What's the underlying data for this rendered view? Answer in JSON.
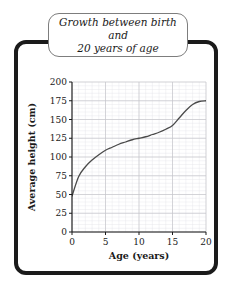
{
  "figure": {
    "title": "Growth between birth and 20 years of age",
    "title_line1": "Growth between birth and",
    "title_line2": "20 years of age",
    "frame_color": "#1b1b1b",
    "background_color": "#ffffff"
  },
  "chart_data": {
    "type": "line",
    "title": "Growth between birth and 20 years of age",
    "xlabel": "Age (years)",
    "ylabel": "Average height (cm)",
    "xlim": [
      0,
      20
    ],
    "ylim": [
      0,
      200
    ],
    "xticks": [
      0,
      5,
      10,
      15,
      20
    ],
    "yticks": [
      0,
      25,
      50,
      75,
      100,
      125,
      150,
      175,
      200
    ],
    "xtick_labels": [
      "0",
      "5",
      "10",
      "15",
      "20"
    ],
    "ytick_labels": [
      "0",
      "25",
      "50",
      "75",
      "100",
      "125",
      "150",
      "175",
      "200"
    ],
    "grid": true,
    "minor_grid": true,
    "minor_grid_x_step": 1,
    "minor_grid_y_step": 5,
    "legend": false,
    "line_color": "#4a4a4a",
    "series": [
      {
        "name": "Average height",
        "x": [
          0,
          1,
          2,
          3,
          4,
          5,
          6,
          7,
          8,
          9,
          10,
          11,
          12,
          13,
          14,
          15,
          16,
          17,
          18,
          19,
          20
        ],
        "values": [
          48,
          74,
          87,
          96,
          103,
          109,
          113,
          117,
          120,
          123,
          125,
          127,
          130,
          133,
          137,
          142,
          152,
          162,
          170,
          174,
          175
        ]
      }
    ]
  },
  "axes": {
    "x_axis_label": "Age (years)",
    "y_axis_label": "Average height (cm)"
  }
}
